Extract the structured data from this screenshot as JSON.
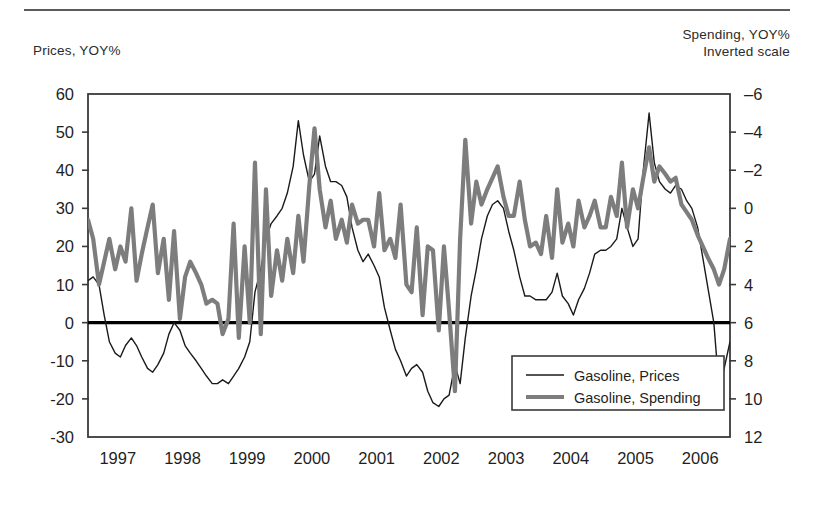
{
  "figure": {
    "left_axis_title": "Prices, YOY%",
    "right_axis_title": "Spending, YOY%\nInverted scale",
    "has_top_rule": true,
    "background_color": "#ffffff"
  },
  "colors": {
    "prices_line": "#1a1a1a",
    "spending_line": "#7d7d7d",
    "axis": "#3a3a3a",
    "zero_line": "#000000",
    "text": "#1f1f1f"
  },
  "legend": {
    "position": "inside-bottom-right",
    "entries": [
      {
        "label": "Gasoline, Prices",
        "color": "#1a1a1a",
        "width": 1.4,
        "series": "prices"
      },
      {
        "label": "Gasoline, Spending",
        "color": "#7d7d7d",
        "width": 4.2,
        "series": "spending"
      }
    ]
  },
  "chart_data": {
    "type": "line",
    "title": "",
    "subtitle": "",
    "xlabel": "",
    "ylabel": "Prices, YOY%",
    "y2label": "Spending, YOY% (Inverted scale)",
    "grid": false,
    "x_tick_labels": [
      "1997",
      "1998",
      "1999",
      "2000",
      "2001",
      "2002",
      "2003",
      "2004",
      "2005",
      "2006"
    ],
    "x_range": [
      1997.0,
      2006.92
    ],
    "ylim": [
      -30,
      60
    ],
    "y_ticks": [
      -30,
      -20,
      -10,
      0,
      10,
      20,
      30,
      40,
      50,
      60
    ],
    "y2lim": [
      12,
      -6
    ],
    "y2_ticks": [
      -6,
      -4,
      -2,
      0,
      2,
      4,
      6,
      8,
      10,
      12
    ],
    "y2_inverted": true,
    "zero_line_value": 0,
    "series": [
      {
        "name": "Gasoline, Prices",
        "axis": "left",
        "color": "#1a1a1a",
        "linewidth": 1.4,
        "x": [
          1997.0,
          1997.08,
          1997.17,
          1997.25,
          1997.33,
          1997.42,
          1997.5,
          1997.58,
          1997.67,
          1997.75,
          1997.83,
          1997.92,
          1998.0,
          1998.08,
          1998.17,
          1998.25,
          1998.33,
          1998.42,
          1998.5,
          1998.58,
          1998.67,
          1998.75,
          1998.83,
          1998.92,
          1999.0,
          1999.08,
          1999.17,
          1999.25,
          1999.33,
          1999.42,
          1999.5,
          1999.58,
          1999.67,
          1999.75,
          1999.83,
          1999.92,
          2000.0,
          2000.08,
          2000.17,
          2000.25,
          2000.33,
          2000.42,
          2000.5,
          2000.58,
          2000.67,
          2000.75,
          2000.83,
          2000.92,
          2001.0,
          2001.08,
          2001.17,
          2001.25,
          2001.33,
          2001.42,
          2001.5,
          2001.58,
          2001.67,
          2001.75,
          2001.83,
          2001.92,
          2002.0,
          2002.08,
          2002.17,
          2002.25,
          2002.33,
          2002.42,
          2002.5,
          2002.58,
          2002.67,
          2002.75,
          2002.83,
          2002.92,
          2003.0,
          2003.08,
          2003.17,
          2003.25,
          2003.33,
          2003.42,
          2003.5,
          2003.58,
          2003.67,
          2003.75,
          2003.83,
          2003.92,
          2004.0,
          2004.08,
          2004.17,
          2004.25,
          2004.33,
          2004.42,
          2004.5,
          2004.58,
          2004.67,
          2004.75,
          2004.83,
          2004.92,
          2005.0,
          2005.08,
          2005.17,
          2005.25,
          2005.33,
          2005.42,
          2005.5,
          2005.58,
          2005.67,
          2005.75,
          2005.83,
          2005.92,
          2006.0,
          2006.08,
          2006.17,
          2006.25,
          2006.33,
          2006.42,
          2006.5,
          2006.58,
          2006.67,
          2006.75,
          2006.83,
          2006.92
        ],
        "y": [
          11,
          12,
          10,
          2,
          -5,
          -8,
          -9,
          -6,
          -4,
          -6,
          -9,
          -12,
          -13,
          -11,
          -8,
          -3,
          0,
          -2,
          -6,
          -8,
          -10,
          -12,
          -14,
          -16,
          -16,
          -15,
          -16,
          -14,
          -12,
          -9,
          -5,
          8,
          14,
          22,
          26,
          28,
          30,
          34,
          41,
          53,
          44,
          37,
          39,
          49,
          41,
          37,
          37,
          36,
          33,
          25,
          19,
          16,
          18,
          15,
          12,
          4,
          -2,
          -7,
          -10,
          -14,
          -12,
          -11,
          -13,
          -18,
          -21,
          -22,
          -20,
          -19,
          -11,
          -16,
          -4,
          7,
          14,
          22,
          28,
          31,
          32,
          30,
          24,
          19,
          12,
          7,
          7,
          6,
          6,
          6,
          8,
          13,
          7,
          5,
          2,
          6,
          9,
          13,
          18,
          19,
          19,
          20,
          22,
          30,
          25,
          20,
          22,
          40,
          55,
          42,
          37,
          35,
          34,
          36,
          35,
          32,
          30,
          25,
          17,
          9,
          0,
          -17,
          -12,
          -5
        ]
      },
      {
        "name": "Gasoline, Spending",
        "axis": "right",
        "color": "#7d7d7d",
        "linewidth": 4.2,
        "x": [
          1997.0,
          1997.08,
          1997.17,
          1997.25,
          1997.33,
          1997.42,
          1997.5,
          1997.58,
          1997.67,
          1997.75,
          1997.83,
          1997.92,
          1998.0,
          1998.08,
          1998.17,
          1998.25,
          1998.33,
          1998.42,
          1998.5,
          1998.58,
          1998.67,
          1998.75,
          1998.83,
          1998.92,
          1999.0,
          1999.08,
          1999.17,
          1999.25,
          1999.33,
          1999.42,
          1999.5,
          1999.58,
          1999.67,
          1999.75,
          1999.83,
          1999.92,
          2000.0,
          2000.08,
          2000.17,
          2000.25,
          2000.33,
          2000.42,
          2000.5,
          2000.58,
          2000.67,
          2000.75,
          2000.83,
          2000.92,
          2001.0,
          2001.08,
          2001.17,
          2001.25,
          2001.33,
          2001.42,
          2001.5,
          2001.58,
          2001.67,
          2001.75,
          2001.83,
          2001.92,
          2002.0,
          2002.08,
          2002.17,
          2002.25,
          2002.33,
          2002.42,
          2002.5,
          2002.58,
          2002.67,
          2002.75,
          2002.83,
          2002.92,
          2003.0,
          2003.08,
          2003.17,
          2003.25,
          2003.33,
          2003.42,
          2003.5,
          2003.58,
          2003.67,
          2003.75,
          2003.83,
          2003.92,
          2004.0,
          2004.08,
          2004.17,
          2004.25,
          2004.33,
          2004.42,
          2004.5,
          2004.58,
          2004.67,
          2004.75,
          2004.83,
          2004.92,
          2005.0,
          2005.08,
          2005.17,
          2005.25,
          2005.33,
          2005.42,
          2005.5,
          2005.58,
          2005.67,
          2005.75,
          2005.83,
          2005.92,
          2006.0,
          2006.08,
          2006.17,
          2006.25,
          2006.33,
          2006.42,
          2006.5,
          2006.58,
          2006.67,
          2006.75,
          2006.83,
          2006.92
        ],
        "y_left_equiv": [
          27,
          22,
          10,
          16,
          22,
          14,
          20,
          16,
          30,
          11,
          18,
          25,
          31,
          13,
          22,
          6,
          24,
          1,
          12,
          16,
          13,
          10,
          5,
          6,
          5,
          -3,
          1,
          26,
          -4,
          20,
          0,
          42,
          -3,
          35,
          7,
          19,
          11,
          22,
          13,
          28,
          16,
          36,
          51,
          35,
          25,
          32,
          22,
          27,
          21,
          31,
          26,
          27,
          27,
          20,
          34,
          19,
          22,
          17,
          31,
          10,
          8,
          25,
          2,
          20,
          19,
          -2,
          20,
          3,
          -18,
          22,
          48,
          26,
          37,
          31,
          35,
          38,
          41,
          33,
          28,
          28,
          37,
          27,
          20,
          21,
          18,
          28,
          17,
          35,
          21,
          26,
          20,
          32,
          25,
          28,
          32,
          25,
          25,
          33,
          28,
          42,
          25,
          35,
          30,
          38,
          46,
          37,
          41,
          39,
          37,
          38,
          31,
          29,
          27,
          23,
          20,
          17,
          14,
          10,
          14,
          22
        ],
        "note": "Values plotted on inverted right axis; y_left_equiv are the pixel-equivalent positions on the left scale"
      }
    ],
    "annotations": []
  }
}
